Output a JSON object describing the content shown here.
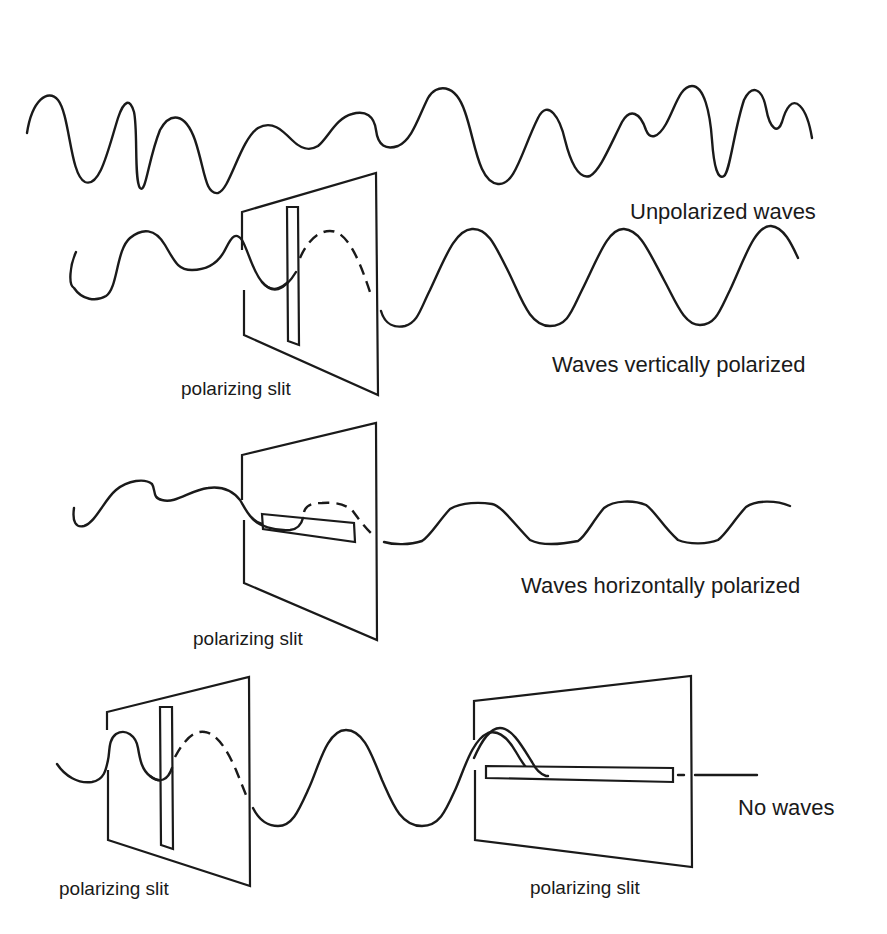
{
  "diagram": {
    "sections": [
      {
        "id": "unpolarized",
        "caption": "Unpolarized waves"
      },
      {
        "id": "vertical",
        "caption": "Waves vertically polarized",
        "slit_label": "polarizing slit",
        "slit_orientation": "vertical"
      },
      {
        "id": "horizontal",
        "caption": "Waves horizontally polarized",
        "slit_label": "polarizing slit",
        "slit_orientation": "horizontal"
      },
      {
        "id": "crossed",
        "caption": "No waves",
        "slit_labels": [
          "polarizing slit",
          "polarizing slit"
        ],
        "slit_orientations": [
          "vertical",
          "horizontal"
        ]
      }
    ],
    "colors": {
      "line": "#1a1a1a",
      "background": "#ffffff"
    }
  }
}
